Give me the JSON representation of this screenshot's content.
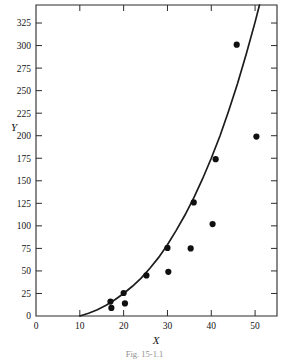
{
  "figure": {
    "caption": "Fig. 15-1.1",
    "frame": {
      "left": 36,
      "right": 277,
      "top": 5,
      "bottom": 316
    }
  },
  "chart_data": {
    "type": "scatter",
    "title": "",
    "xlabel": "X",
    "ylabel": "Y",
    "xlim": [
      0,
      55
    ],
    "ylim": [
      0,
      345
    ],
    "grid": false,
    "legend": null,
    "xticks": [
      0,
      10,
      20,
      30,
      40,
      50
    ],
    "xticklabels": [
      "0",
      "10",
      "20",
      "30",
      "40",
      "50"
    ],
    "yticks": [
      0,
      25,
      50,
      75,
      100,
      125,
      150,
      175,
      200,
      225,
      250,
      275,
      300,
      325
    ],
    "yticklabels": [
      "0",
      "25",
      "50",
      "75",
      "100",
      "125",
      "150",
      "175",
      "200",
      "225",
      "250",
      "275",
      "300",
      "325"
    ],
    "points": [
      {
        "x": 17.0,
        "y": 16.0
      },
      {
        "x": 17.2,
        "y": 9.0
      },
      {
        "x": 20.0,
        "y": 25.5
      },
      {
        "x": 20.3,
        "y": 14.0
      },
      {
        "x": 25.2,
        "y": 45.0
      },
      {
        "x": 30.0,
        "y": 75.5
      },
      {
        "x": 30.2,
        "y": 49.0
      },
      {
        "x": 35.3,
        "y": 75.0
      },
      {
        "x": 36.0,
        "y": 126.0
      },
      {
        "x": 40.3,
        "y": 102.0
      },
      {
        "x": 41.0,
        "y": 174.0
      },
      {
        "x": 45.8,
        "y": 301.0
      },
      {
        "x": 50.3,
        "y": 199.0
      }
    ],
    "series": [
      {
        "name": "fitted curve",
        "type": "line",
        "x": [
          10,
          12,
          14,
          16,
          18,
          20,
          22,
          24,
          26,
          28,
          30,
          32,
          34,
          36,
          38,
          40,
          42,
          44,
          46,
          48,
          50,
          52,
          54,
          55
        ],
        "y": [
          0,
          3,
          7,
          12,
          18,
          25,
          33,
          42,
          53,
          65,
          79,
          95,
          112,
          131,
          152,
          175,
          200,
          228,
          258,
          291,
          326,
          364,
          404,
          425
        ]
      }
    ]
  },
  "colors": {
    "axis": "#2b2b2b",
    "curve": "#1c1c1c",
    "point": "#101010",
    "background": "#ffffff"
  }
}
